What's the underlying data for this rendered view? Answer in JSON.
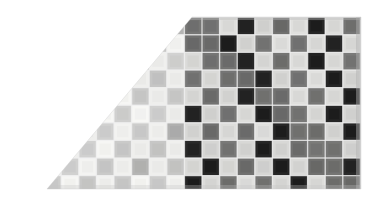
{
  "figure": {
    "title": "Checkerboard Texture Swatch",
    "background_color": "#ffffff"
  },
  "canvas": {
    "width": 380,
    "height": 206
  },
  "swatch": {
    "left": 8,
    "top": 17,
    "right": 361,
    "bottom": 189,
    "diagonal_apex_x": 192,
    "diagonal_base_x": 47,
    "note": "Lower-left triangular region is removed; diagonal runs from (192,17) down-left to (47,189)."
  },
  "grid": {
    "cell_size": 17.6,
    "origin_x": 8.4,
    "origin_y": 17.2,
    "columns": 20,
    "rows": 10,
    "line_color": "#efefef",
    "line_width": 1.4,
    "pattern": "checkerboard",
    "tone_split_x": 192,
    "tone_split_label": "light half / dark half"
  },
  "palette": {
    "light_half_light_cell": "#f3f3f1",
    "light_half_mid_cell": "#cccccb",
    "light_half_dark_cell": "#b3b3b2",
    "dark_half_light_cell": "#dcdcda",
    "dark_half_mid_cell": "#757574",
    "dark_half_dark_cell": "#282828",
    "grid_line": "#efefef",
    "edge_shadow": "#9a9a9a"
  },
  "legend": {
    "visible": false,
    "items": []
  },
  "labels": {
    "visible": false,
    "texts": []
  },
  "chart_data": {
    "type": "heatmap",
    "title": "Checkerboard Texture Swatch",
    "xlabel": "",
    "ylabel": "",
    "columns": 20,
    "rows": 10,
    "cell_size_px": 17.6,
    "legend": "none",
    "grid": true,
    "tone_regions": [
      {
        "name": "light-half",
        "x_range_px": [
          8,
          192
        ],
        "base_colors": [
          "#f3f3f1",
          "#cccccb"
        ]
      },
      {
        "name": "dark-half",
        "x_range_px": [
          192,
          361
        ],
        "base_colors": [
          "#dcdcda",
          "#757574",
          "#282828"
        ]
      }
    ],
    "clip_shape": "right-trapezoid",
    "clip_points_px": [
      [
        192,
        17
      ],
      [
        361,
        17
      ],
      [
        361,
        189
      ],
      [
        47,
        189
      ]
    ],
    "values": [
      [
        0,
        1,
        0,
        1,
        0,
        1,
        0,
        1,
        0,
        1,
        2,
        3,
        2,
        3,
        2,
        3,
        2,
        3,
        2,
        3
      ],
      [
        1,
        0,
        1,
        0,
        1,
        0,
        1,
        0,
        1,
        0,
        3,
        2,
        3,
        2,
        3,
        2,
        3,
        2,
        3,
        2
      ],
      [
        0,
        1,
        0,
        1,
        0,
        1,
        0,
        1,
        0,
        1,
        2,
        3,
        2,
        3,
        2,
        3,
        2,
        3,
        2,
        3
      ],
      [
        1,
        0,
        1,
        0,
        1,
        0,
        1,
        0,
        1,
        0,
        3,
        2,
        3,
        2,
        3,
        2,
        3,
        2,
        3,
        2
      ],
      [
        0,
        1,
        0,
        1,
        0,
        1,
        0,
        1,
        0,
        1,
        2,
        3,
        2,
        3,
        2,
        3,
        2,
        3,
        2,
        3
      ],
      [
        1,
        0,
        1,
        0,
        1,
        0,
        1,
        0,
        1,
        0,
        3,
        2,
        3,
        2,
        3,
        2,
        3,
        2,
        3,
        2
      ],
      [
        0,
        1,
        0,
        1,
        0,
        1,
        0,
        1,
        0,
        1,
        2,
        3,
        2,
        3,
        2,
        3,
        2,
        3,
        2,
        3
      ],
      [
        1,
        0,
        1,
        0,
        1,
        0,
        1,
        0,
        1,
        0,
        3,
        2,
        3,
        2,
        3,
        2,
        3,
        2,
        3,
        2
      ],
      [
        0,
        1,
        0,
        1,
        0,
        1,
        0,
        1,
        0,
        1,
        2,
        3,
        2,
        3,
        2,
        3,
        2,
        3,
        2,
        3
      ],
      [
        1,
        0,
        1,
        0,
        1,
        0,
        1,
        0,
        1,
        0,
        3,
        2,
        3,
        2,
        3,
        2,
        3,
        2,
        3,
        2
      ]
    ],
    "value_legend": {
      "0": "light-half light cell (#f3f3f1)",
      "1": "light-half mid cell (#cccccb)",
      "2": "dark-half light cell (#dcdcda)",
      "3": "dark-half dark cell (#282828)"
    }
  }
}
